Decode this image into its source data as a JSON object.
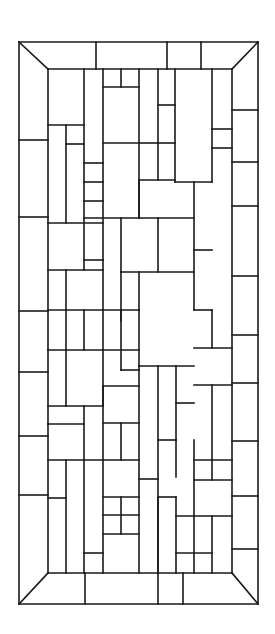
{
  "figure": {
    "title": "Stained glass window pattern",
    "stroke_color": "#1a1a1a",
    "background_color": "#ffffff",
    "width": 275,
    "height": 634
  },
  "frame": {
    "outer": {
      "x1": 19,
      "y1": 42,
      "x2": 258,
      "y2": 604
    },
    "inner": {
      "x1": 48,
      "y1": 69,
      "x2": 232,
      "y2": 573
    }
  },
  "border_segments": {
    "top": [
      96,
      167,
      201
    ],
    "bottom": [
      85,
      158,
      183
    ],
    "left": [
      140,
      217,
      311,
      372,
      436,
      495
    ],
    "right": [
      110,
      162,
      206,
      276,
      335,
      383,
      441,
      496,
      549
    ]
  },
  "interior_lines": [
    [
      84,
      69,
      84,
      270
    ],
    [
      48,
      125,
      84,
      125
    ],
    [
      66,
      125,
      66,
      223
    ],
    [
      66,
      144,
      84,
      144
    ],
    [
      48,
      223,
      103,
      223
    ],
    [
      103,
      69,
      103,
      260
    ],
    [
      84,
      163,
      103,
      163
    ],
    [
      84,
      182,
      103,
      182
    ],
    [
      84,
      201,
      103,
      201
    ],
    [
      103,
      87,
      139,
      87
    ],
    [
      121,
      69,
      121,
      87
    ],
    [
      139,
      69,
      139,
      218
    ],
    [
      103,
      143,
      139,
      143
    ],
    [
      158,
      69,
      158,
      180
    ],
    [
      139,
      143,
      158,
      143
    ],
    [
      175,
      69,
      175,
      182
    ],
    [
      158,
      105,
      175,
      105
    ],
    [
      158,
      143,
      175,
      143
    ],
    [
      212,
      69,
      212,
      182
    ],
    [
      212,
      129,
      232,
      129
    ],
    [
      212,
      148,
      232,
      148
    ],
    [
      84,
      218,
      194,
      218
    ],
    [
      121,
      218,
      121,
      272
    ],
    [
      158,
      218,
      158,
      272
    ],
    [
      139,
      180,
      175,
      180
    ],
    [
      139,
      180,
      139,
      218
    ],
    [
      175,
      182,
      212,
      182
    ],
    [
      194,
      182,
      194,
      310
    ],
    [
      194,
      250,
      212,
      250
    ],
    [
      48,
      270,
      103,
      270
    ],
    [
      66,
      270,
      66,
      310
    ],
    [
      103,
      260,
      103,
      310
    ],
    [
      84,
      260,
      103,
      260
    ],
    [
      121,
      272,
      121,
      370
    ],
    [
      121,
      272,
      194,
      272
    ],
    [
      139,
      272,
      139,
      310
    ],
    [
      121,
      370,
      139,
      370
    ],
    [
      48,
      310,
      139,
      310
    ],
    [
      66,
      310,
      66,
      350
    ],
    [
      84,
      310,
      84,
      350
    ],
    [
      103,
      310,
      103,
      350
    ],
    [
      121,
      310,
      121,
      321
    ],
    [
      48,
      350,
      139,
      350
    ],
    [
      48,
      350,
      48,
      350
    ],
    [
      66,
      350,
      66,
      406
    ],
    [
      103,
      350,
      103,
      406
    ],
    [
      139,
      310,
      139,
      366
    ],
    [
      139,
      366,
      194,
      366
    ],
    [
      176,
      366,
      176,
      440
    ],
    [
      176,
      403,
      194,
      403
    ],
    [
      194,
      310,
      212,
      310
    ],
    [
      212,
      310,
      212,
      348
    ],
    [
      194,
      348,
      232,
      348
    ],
    [
      194,
      385,
      232,
      385
    ],
    [
      212,
      385,
      212,
      460
    ],
    [
      48,
      406,
      103,
      406
    ],
    [
      84,
      406,
      84,
      460
    ],
    [
      48,
      424,
      84,
      424
    ],
    [
      48,
      424,
      48,
      424
    ],
    [
      103,
      386,
      139,
      386
    ],
    [
      103,
      386,
      103,
      460
    ],
    [
      103,
      423,
      139,
      423
    ],
    [
      121,
      423,
      121,
      460
    ],
    [
      48,
      460,
      139,
      460
    ],
    [
      139,
      366,
      139,
      573
    ],
    [
      158,
      366,
      158,
      573
    ],
    [
      158,
      440,
      176,
      440
    ],
    [
      176,
      440,
      176,
      477
    ],
    [
      194,
      440,
      194,
      573
    ],
    [
      194,
      460,
      232,
      460
    ],
    [
      212,
      460,
      212,
      480
    ],
    [
      194,
      480,
      232,
      480
    ],
    [
      66,
      460,
      66,
      573
    ],
    [
      48,
      498,
      66,
      498
    ],
    [
      84,
      460,
      84,
      573
    ],
    [
      84,
      553,
      103,
      553
    ],
    [
      103,
      460,
      103,
      573
    ],
    [
      103,
      497,
      139,
      497
    ],
    [
      121,
      497,
      121,
      534
    ],
    [
      103,
      515,
      139,
      515
    ],
    [
      103,
      534,
      139,
      534
    ],
    [
      139,
      479,
      158,
      479
    ],
    [
      158,
      497,
      176,
      497
    ],
    [
      176,
      497,
      176,
      573
    ],
    [
      158,
      497,
      158,
      573
    ],
    [
      176,
      516,
      232,
      516
    ],
    [
      212,
      516,
      212,
      573
    ],
    [
      176,
      553,
      212,
      553
    ]
  ],
  "legend": []
}
